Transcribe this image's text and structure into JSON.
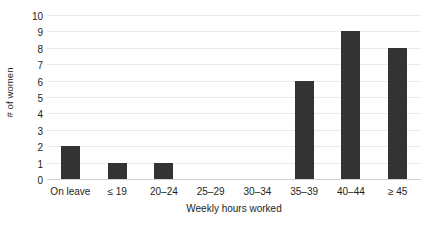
{
  "chart_data": {
    "type": "bar",
    "title": "",
    "subtitle": "",
    "xlabel": "Weekly hours worked",
    "ylabel": "# of women",
    "categories": [
      "On leave",
      "≤ 19",
      "20–24",
      "25–29",
      "30–34",
      "35–39",
      "40–44",
      "≥ 45"
    ],
    "values": [
      2,
      1,
      1,
      0,
      0,
      6,
      9,
      8
    ],
    "ylim": [
      0,
      10
    ],
    "yticks": [
      0,
      1,
      2,
      3,
      4,
      5,
      6,
      7,
      8,
      9,
      10
    ],
    "ytick_labels": [
      "0",
      "1",
      "2",
      "3",
      "4",
      "5",
      "6",
      "7",
      "8",
      "9",
      "10"
    ],
    "grid": true,
    "grid_axis": "y",
    "legend": false,
    "legend_position": "none",
    "annotations": [],
    "bar_color": "#333333",
    "gridline_color": "#e9e9ea",
    "axis_color": "#d2d2d3",
    "text_color": "#231f20",
    "background_color": "#ffffff"
  }
}
